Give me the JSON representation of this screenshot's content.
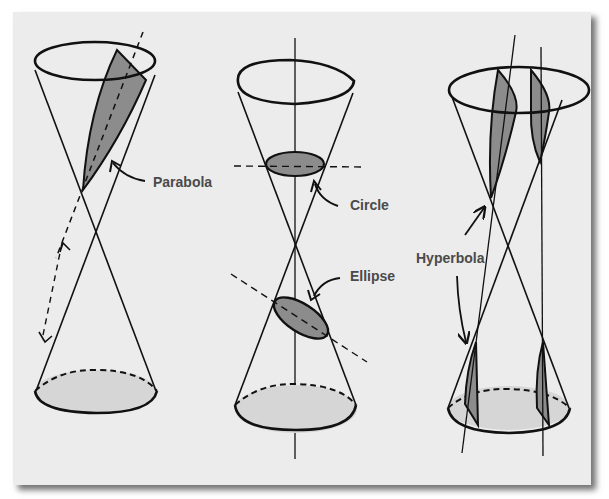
{
  "figure": {
    "background_color": "#ececec",
    "section_fill": "#8c8c8c",
    "base_fill": "#d6d6d6",
    "line_color": "#111111",
    "label_color": "#4a4a4a"
  },
  "panels": [
    {
      "id": "parabola",
      "label": "Parabola",
      "description": "Plane parallel to cone side cuts one nappe"
    },
    {
      "id": "circle",
      "label": "Circle",
      "description": "Plane perpendicular to cone axis"
    },
    {
      "id": "ellipse",
      "label": "Ellipse",
      "description": "Tilted plane cuts one nappe fully"
    },
    {
      "id": "hyperbola",
      "label": "Hyperbola",
      "description": "Plane parallel to axis cuts both nappes"
    }
  ]
}
